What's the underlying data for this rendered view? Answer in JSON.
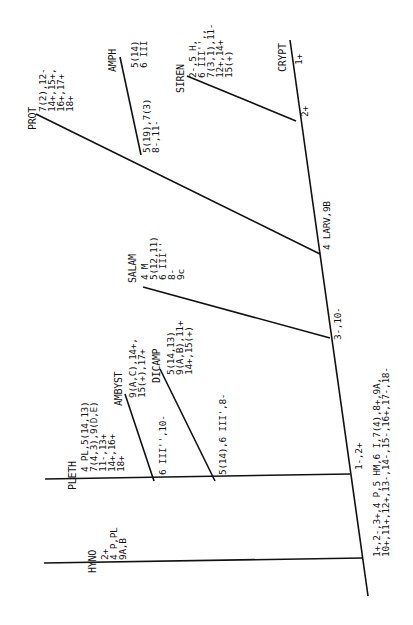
{
  "taxa": [
    {
      "name": "PROT",
      "chars": "7(2),12-\n14+,15+,\n16+,17+\n18+"
    },
    {
      "name": "AMPH",
      "chars": "5(14)\n6 III"
    },
    {
      "name": "SIREN",
      "chars": "2-,5 H,\n6 III'',,\n7(3,1),11-\n12+,14+\n15(+)"
    },
    {
      "name": "CRYPT",
      "chars": "1+"
    },
    {
      "name": "SALAM",
      "chars": "4 M\n5(12,11)\n6 III''\n8-\n9c"
    },
    {
      "name": "DICAMP",
      "chars": "5(14,13)\n9(A,B),11+\n14+,15(+)"
    },
    {
      "name": "AMBYST",
      "chars": "9(A,C),14+,\n15(+),17+"
    },
    {
      "name": "PLETH",
      "chars": "4 PL,5(14,13)\n7(4,3),9(D,E)\n11-,13+\n14+,16+\n18+"
    },
    {
      "name": "HYNO",
      "chars": "2+\n4 P,PL\n9A,B"
    }
  ],
  "nodes": [
    {
      "id": "amph-prot",
      "label": "5(19),7(3)\n8-,11-"
    },
    {
      "id": "siren-crypt",
      "label": "2+"
    },
    {
      "id": "larv",
      "label": "4 LARV,9B"
    },
    {
      "id": "salam",
      "label": "3-,10-"
    },
    {
      "id": "ambyst",
      "label": "6 III'',10-"
    },
    {
      "id": "dicamp",
      "label": "5(14),6 III',8-"
    },
    {
      "id": "pleth",
      "label": "1-,2+"
    },
    {
      "id": "root",
      "label": "1+,2-,3+,4 P,5 HM,6 I,7(4),8+,9A,\n10+,11+,12+,13-,14-,15-,16+,17-,18-"
    }
  ]
}
